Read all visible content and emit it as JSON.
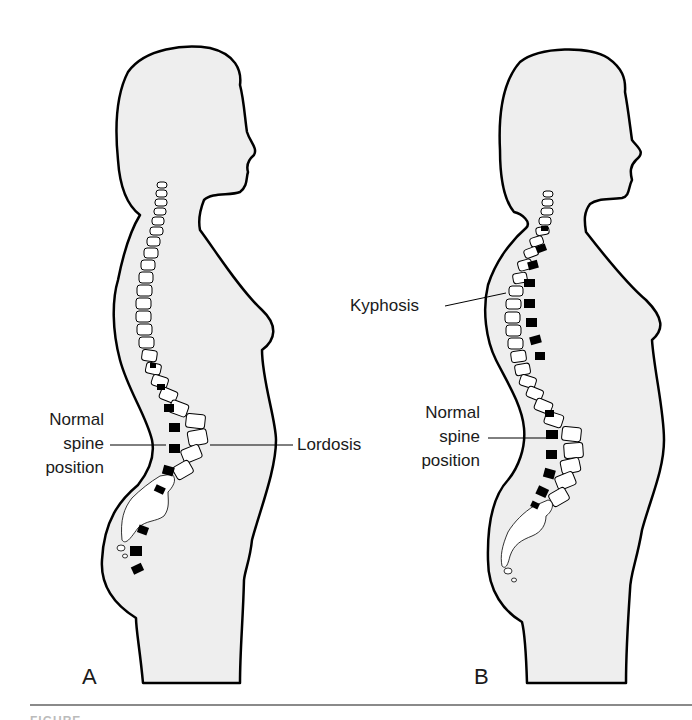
{
  "figure": {
    "type": "anatomical-comparison",
    "colors": {
      "silhouette_fill": "#eeeeee",
      "outline": "#000000",
      "vertebra_fill": "#ffffff",
      "normal_spine_marker": "#000000",
      "background": "#ffffff",
      "rule": "#8a8a8a"
    }
  },
  "panels": [
    {
      "letter": "A",
      "labels": {
        "normal_spine": [
          "Normal",
          "spine",
          "position"
        ],
        "curvature": "Lordosis"
      }
    },
    {
      "letter": "B",
      "labels": {
        "normal_spine": [
          "Normal",
          "spine",
          "position"
        ],
        "curvature": "Kyphosis"
      }
    }
  ],
  "caption": {
    "partial_text": "FIGURE"
  }
}
